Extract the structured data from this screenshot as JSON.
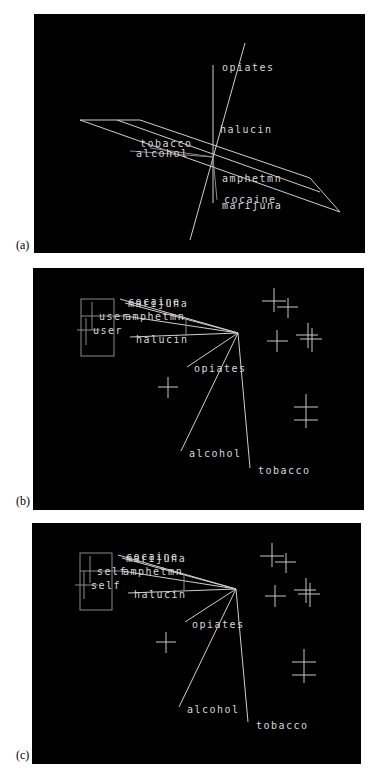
{
  "figure": {
    "panels": [
      {
        "id": "a",
        "label": "(a)",
        "variables": [
          "opiates",
          "halucin",
          "tobacco",
          "alcohol",
          "amphetmn",
          "cocaine",
          "marijuna"
        ]
      },
      {
        "id": "b",
        "label": "(b)",
        "group_labels": [
          "user",
          "user"
        ],
        "variables": [
          "marijuna",
          "cocaine",
          "amphetmn",
          "halucin",
          "opiates",
          "alcohol",
          "tobacco"
        ],
        "overlapped_label": "marijuna"
      },
      {
        "id": "c",
        "label": "(c)",
        "group_labels": [
          "self",
          "self"
        ],
        "variables": [
          "marijuna",
          "cocaine",
          "amphetmn",
          "halucin",
          "opiates",
          "alcohol",
          "tobacco"
        ],
        "overlapped_label": "marijuna"
      }
    ],
    "colors": {
      "background": "#000000",
      "lines": "#cfcfcf",
      "page": "#ffffff"
    }
  }
}
